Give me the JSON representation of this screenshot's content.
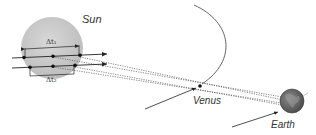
{
  "labels": {
    "sun": "Sun",
    "venus": "Venus",
    "earth": "Earth",
    "delta_t1": "Δt₁",
    "delta_t2": "Δt₂"
  },
  "colors": {
    "sun_fill": "#c9c9c9",
    "sun_edge": "#b0b0b0",
    "earth_fill": "#6f6f6f",
    "line": "#222222",
    "orbit": "#555555"
  },
  "diagram": {
    "elements": [
      {
        "type": "body",
        "name": "Sun"
      },
      {
        "type": "body",
        "name": "Venus"
      },
      {
        "type": "body",
        "name": "Earth"
      },
      {
        "type": "path",
        "name": "transit-path-1",
        "interval": "Δt₁"
      },
      {
        "type": "path",
        "name": "transit-path-2",
        "interval": "Δt₂"
      },
      {
        "type": "orbit",
        "name": "Venus orbit"
      }
    ]
  }
}
